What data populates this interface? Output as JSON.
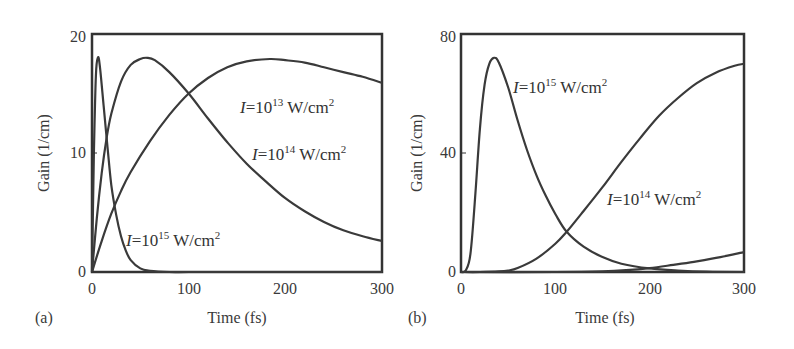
{
  "chart_data": [
    {
      "panel": "(a)",
      "type": "line",
      "title": "",
      "xlabel": "Time (fs)",
      "ylabel": "Gain (1/cm)",
      "xlim": [
        0,
        300
      ],
      "ylim": [
        0,
        20
      ],
      "xticks": [
        0,
        100,
        200,
        300
      ],
      "yticks": [
        0,
        10,
        20
      ],
      "grid": false,
      "legend": "none (inline curve annotations)",
      "series": [
        {
          "name": "I=10^15 W/cm^2",
          "label_parts": {
            "base": "=10",
            "exp": "15",
            "unit": " W/cm",
            "unit_exp": "2"
          },
          "x": [
            0,
            2,
            4,
            6,
            8,
            12,
            16,
            20,
            25,
            30,
            35,
            40,
            50,
            60,
            80,
            100,
            150,
            200,
            250,
            300
          ],
          "y": [
            0,
            10,
            16.5,
            18,
            17.4,
            14,
            10.5,
            7.3,
            4.8,
            3.0,
            1.8,
            1.0,
            0.3,
            0.1,
            0,
            0,
            0,
            0,
            0,
            0
          ]
        },
        {
          "name": "I=10^14 W/cm^2",
          "label_parts": {
            "base": "=10",
            "exp": "14",
            "unit": " W/cm",
            "unit_exp": "2"
          },
          "x": [
            0,
            5,
            10,
            15,
            20,
            30,
            40,
            50,
            57,
            65,
            80,
            100,
            120,
            140,
            160,
            180,
            200,
            220,
            240,
            260,
            280,
            300
          ],
          "y": [
            0,
            4.5,
            8.3,
            11.2,
            13.3,
            16.0,
            17.4,
            17.9,
            18.0,
            17.8,
            16.8,
            15.0,
            12.9,
            10.9,
            9.1,
            7.6,
            6.2,
            5.1,
            4.2,
            3.5,
            3.0,
            2.6
          ]
        },
        {
          "name": "I=10^13 W/cm^2",
          "label_parts": {
            "base": "=10",
            "exp": "13",
            "unit": " W/cm",
            "unit_exp": "2"
          },
          "x": [
            0,
            10,
            20,
            30,
            40,
            60,
            80,
            100,
            120,
            140,
            160,
            184,
            200,
            220,
            240,
            260,
            280,
            300
          ],
          "y": [
            0,
            2.6,
            4.9,
            6.8,
            8.4,
            11.0,
            13.2,
            15.0,
            16.3,
            17.2,
            17.7,
            17.9,
            17.8,
            17.6,
            17.2,
            16.8,
            16.4,
            15.9
          ]
        }
      ],
      "annotations": [
        {
          "text": "I=10^13 W/cm^2",
          "at": [
            250,
            15.0
          ]
        },
        {
          "text": "I=10^14 W/cm^2",
          "at": [
            262,
            10.4
          ]
        },
        {
          "text": "I=10^15 W/cm^2",
          "at": [
            105,
            1.8
          ]
        }
      ]
    },
    {
      "panel": "(b)",
      "type": "line",
      "title": "",
      "xlabel": "Time (fs)",
      "ylabel": "Gain (1/cm)",
      "xlim": [
        0,
        300
      ],
      "ylim": [
        0,
        80
      ],
      "xticks": [
        0,
        100,
        200,
        300
      ],
      "yticks": [
        0,
        40,
        80
      ],
      "grid": false,
      "legend": "none (inline curve annotations)",
      "series": [
        {
          "name": "I=10^15 W/cm^2",
          "x": [
            0,
            5,
            10,
            15,
            20,
            25,
            30,
            35,
            40,
            50,
            60,
            70,
            80,
            90,
            100,
            112,
            130,
            150,
            170,
            200,
            230,
            260,
            300
          ],
          "y": [
            0,
            0.5,
            6,
            25,
            48,
            63,
            70,
            72,
            70.5,
            62,
            51,
            41,
            32.5,
            25.5,
            19.5,
            13.5,
            8.5,
            5.0,
            2.8,
            1.2,
            0.5,
            0.1,
            0
          ]
        },
        {
          "name": "I=10^14 W/cm^2",
          "x": [
            0,
            20,
            40,
            50,
            60,
            80,
            100,
            112,
            130,
            150,
            170,
            190,
            210,
            230,
            250,
            270,
            290,
            300
          ],
          "y": [
            0,
            0,
            0.2,
            0.5,
            1.3,
            4.5,
            9.5,
            13.5,
            20.5,
            28.5,
            37,
            45,
            52.5,
            58.5,
            63.5,
            67,
            69.3,
            70
          ]
        },
        {
          "name": "I=10^13 W/cm^2",
          "x": [
            0,
            100,
            150,
            175,
            200,
            225,
            250,
            275,
            300
          ],
          "y": [
            0,
            0,
            0.2,
            0.6,
            1.3,
            2.4,
            3.6,
            5.0,
            6.7
          ]
        }
      ],
      "annotations": [
        {
          "text": "I=10^15 W/cm^2",
          "at": [
            55,
            60
          ]
        },
        {
          "text": "I=10^14 W/cm^2",
          "at": [
            150,
            22
          ]
        }
      ]
    }
  ],
  "figure": {
    "panels": [
      {
        "tag": "(a)",
        "xlabel": "Time (fs)",
        "ylabel": "Gain (1/cm)",
        "xtick_labels": [
          "0",
          "100",
          "200",
          "300"
        ],
        "ytick_labels": [
          "0",
          "10",
          "20"
        ],
        "labels": [
          {
            "i": "I",
            "base": "=10",
            "exp": "13",
            "unit": " W/cm",
            "uexp": "2"
          },
          {
            "i": "I",
            "base": "=10",
            "exp": "14",
            "unit": " W/cm",
            "uexp": "2"
          },
          {
            "i": "I",
            "base": "=10",
            "exp": "15",
            "unit": " W/cm",
            "uexp": "2"
          }
        ]
      },
      {
        "tag": "(b)",
        "xlabel": "Time (fs)",
        "ylabel": "Gain (1/cm)",
        "xtick_labels": [
          "0",
          "100",
          "200",
          "300"
        ],
        "ytick_labels": [
          "0",
          "40",
          "80"
        ],
        "labels": [
          {
            "i": "I",
            "base": "=10",
            "exp": "15",
            "unit": " W/cm",
            "uexp": "2"
          },
          {
            "i": "I",
            "base": "=10",
            "exp": "14",
            "unit": " W/cm",
            "uexp": "2"
          }
        ]
      }
    ],
    "colors": {
      "curve": "#3a3a3a",
      "axis": "#333333",
      "background": "#ffffff"
    }
  }
}
